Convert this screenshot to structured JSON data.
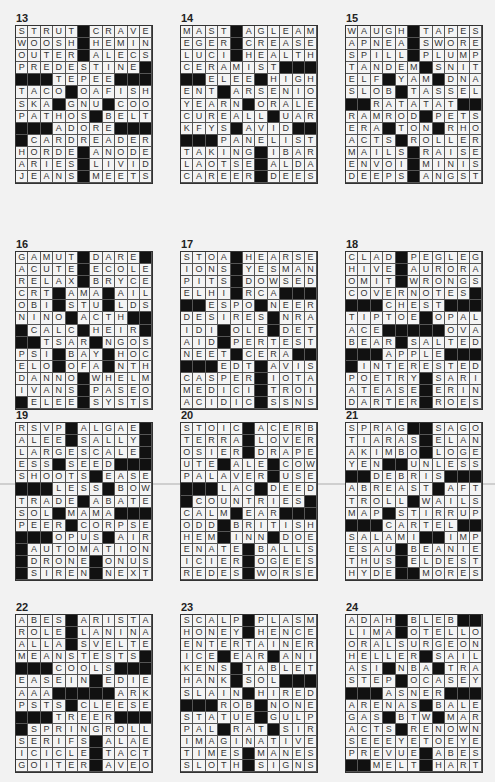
{
  "page": {
    "puzzles": [
      {
        "number": "13",
        "rows": [
          "STRUT#CRAVE",
          "WOOSH#HEMIN",
          "OUTER#ALECS",
          "PREDESTINE#",
          "###TEPEE###",
          "TACO#OAFISH",
          "SKA#GNU#COO",
          "PATHOS#BELT",
          "###ADORE###",
          "#CARDREADER",
          "HORDE#ANODE",
          "ARIES#LIVID",
          "JEANS#MEETS"
        ]
      },
      {
        "number": "14",
        "rows": [
          "MAST#AGLEAM",
          "EGER#CREASE",
          "LUCI#HEALTH",
          "CERAMIST###",
          "##ELEE#HIGH",
          "ENT#ARSENIO",
          "YEARN#ORALE",
          "CUREALL#UAR",
          "KFYS#AVID##",
          "###PANELIST",
          "TAKING#IBAR",
          "LAOTSE#ALDA",
          "CAREER#DEES"
        ]
      },
      {
        "number": "15",
        "rows": [
          "WAUGH#TAPES",
          "APNEA#SWORE",
          "SPILL#PLUMP",
          "TANDEM#SNIT",
          "ELF#YAM#DNA",
          "SLOB#TASSEL",
          "##RATATAT##",
          "RAMROD#PETS",
          "ERA#TON#RHO",
          "ACTS#ROLLER",
          "MAILS#RAISE",
          "ENVOI#MINIS",
          "DEEPS#ANGST"
        ]
      },
      {
        "number": "16",
        "rows": [
          "GAMUT#DARE#",
          "ACUTE#ECOLE",
          "RELAX#BRYCE",
          "CRT#AMA#AIL",
          "OBI#STU#LDS",
          "NINO#ACTH##",
          "#CALC#HEIR#",
          "##TSAR#NGOS",
          "PSI#BAY#HOC",
          "ELO#OFA#NTH",
          "DANNO#WHELM",
          "IVANS#PASEO",
          "#ELEE#SYSTS"
        ]
      },
      {
        "number": "17",
        "rows": [
          "STOA#HEARSE",
          "IONS#YESMAN",
          "PITS#DOWSED",
          "ELHI#RCA###",
          "##ESPO#NEER",
          "DESIRES#NRA",
          "IDI#OLE#DET",
          "AID#PERTEST",
          "NEET#CERA##",
          "###EDT#AVIS",
          "CASPER#IOTA",
          "MEDICI#TROI",
          "ACIDIC#SSNS"
        ]
      },
      {
        "number": "18",
        "rows": [
          "CLAD#PEGLEG",
          "HIVE#AURORA",
          "OMIT#WRONGS",
          "COVERNOTES#",
          "###CHEST###",
          "TIPTOE#OPAL",
          "ACE#####OVA",
          "BEAR#SALTED",
          "###APPLE###",
          "#INTERESTED",
          "POETRY#SARI",
          "ATEASE#ERIN",
          "DARTER#ROES"
        ]
      },
      {
        "number": "19",
        "rows": [
          "RSVP#ALGAE#",
          "ALEE#SALLY#",
          "LARGESCALE#",
          "ESS#SEED###",
          "SHOOTS#EASE",
          "###LESS#BOW",
          "TRADE#ABATE",
          "SOL#MAMA###",
          "PEER#CORPSE",
          "###OPUS#AIR",
          "#AUTOMATION",
          "#DRONE#ONUS",
          "#SIREN#NEXT"
        ]
      },
      {
        "number": "20",
        "rows": [
          "STOIC#ACERB",
          "TERRA#LOVER",
          "OSIER#DRAPE",
          "UTE#ALE#COW",
          "PALAVER#USE",
          "###LAC#DEED",
          "#COUNTRIES#",
          "CALM#EAR###",
          "ODD#BRITISH",
          "HEM#INN#DOE",
          "ENATE#BALLS",
          "ICIER#OGEES",
          "REDES#WORSE"
        ]
      },
      {
        "number": "21",
        "rows": [
          "SPRAG##SAGO",
          "TIARAS#ELAN",
          "AKIMBO#LOGE",
          "YEN##UNLESS",
          "##DEBRIS###",
          "ABREAST#AFT",
          "TROLL#WAILS",
          "MAP#STIRRUP",
          "###CARTEL##",
          "SALAMI##IMP",
          "ESAU#BEANIE",
          "THUS#ELDEST",
          "HYDE##MORES"
        ]
      },
      {
        "number": "22",
        "rows": [
          "ABES#ARISTA",
          "ROLE#LANINA",
          "ALLA#SVELTE",
          "MEANSTESTS#",
          "###COOLS###",
          "EASEIN#EDIE",
          "AAA#####ARK",
          "PSTS#CLEESE",
          "###TREER###",
          "#SPRINGROLL",
          "SERIFS#ALAE",
          "ICICLE#TACT",
          "GOITER#AVEO"
        ]
      },
      {
        "number": "23",
        "rows": [
          "SCALP#PLASM",
          "HONEY#HENCE",
          "ENTERTAINER",
          "ICE#EAR#ANI",
          "KENS#TABLET",
          "HANK#SOL###",
          "SLAIN#HIRED",
          "###ROB#NONE",
          "STATUE#GULP",
          "PAL#RAT#SIR",
          "IMAGINATIVE",
          "TIMES#MANES",
          "SLOTH#SIGNS"
        ]
      },
      {
        "number": "24",
        "rows": [
          "ADAH#BLEB##",
          "LIMA#OTELLO",
          "ORALSURGEON",
          "HELLER#SAIL",
          "ASI#NBA#TRA",
          "STEP#OCASEY",
          "###ASNER###",
          "ARENAS#BALE",
          "GAS#BTW#MAR",
          "ACTS#RENOWN",
          "SEEEYETOEYE",
          "PREVUE#ABES",
          "##MELT#HART"
        ]
      }
    ]
  }
}
